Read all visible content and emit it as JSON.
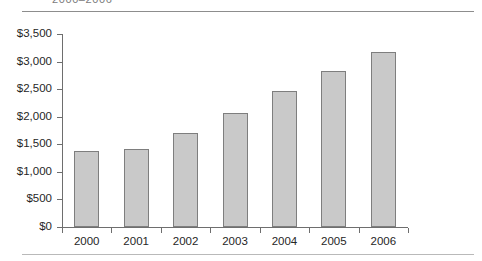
{
  "caption": {
    "text": "2000–2006"
  },
  "colors": {
    "bar_fill": "#c9c9c9",
    "bar_border": "#7e7e7e",
    "axis": "#6e6e6e",
    "text": "#262626",
    "top_rule": "#8d8d8d",
    "bottom_rule": "#b9b9b9"
  },
  "chart_data": {
    "type": "bar",
    "title": "",
    "subtitle": "",
    "xlabel": "",
    "ylabel": "",
    "categories": [
      "2000",
      "2001",
      "2002",
      "2003",
      "2004",
      "2005",
      "2006"
    ],
    "values": [
      1370,
      1420,
      1710,
      2070,
      2460,
      2830,
      3170
    ],
    "ylim": [
      0,
      3500
    ],
    "ytick_values": [
      0,
      500,
      1000,
      1500,
      2000,
      2500,
      3000,
      3500
    ],
    "ytick_labels": [
      "$0",
      "$500",
      "$1,000",
      "$1,500",
      "$2,000",
      "$2,500",
      "$3,000",
      "$3,500"
    ],
    "xtick_labels": [
      "2000",
      "2001",
      "2002",
      "2003",
      "2004",
      "2005",
      "2006"
    ],
    "grid": false,
    "legend": null,
    "legend_position": "none",
    "annotations": []
  }
}
